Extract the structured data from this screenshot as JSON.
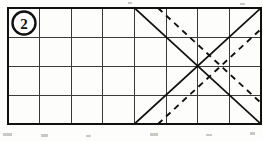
{
  "figure": {
    "label": "2",
    "label_name": "figure-number-badge",
    "background_color": "#fdfdfb",
    "ink_color": "#111111",
    "grid_line_color": "#3a3a3a"
  },
  "grid": {
    "columns": 8,
    "rows": 4,
    "left": 8,
    "top": 8,
    "right": 261,
    "bottom": 124,
    "cell_width": 31.6,
    "cell_height": 29,
    "x_positions": [
      8,
      39.6,
      71.2,
      102.8,
      134.4,
      166,
      197.6,
      229.2,
      261
    ],
    "y_positions": [
      8,
      37,
      66,
      95,
      124
    ]
  },
  "badge": {
    "center_x": 24,
    "center_y": 23,
    "radius": 11.5
  },
  "shapes": {
    "solid_x": {
      "name": "solid-diagonal-cross",
      "center_x": 197.6,
      "center_y": 66,
      "lines": [
        {
          "name": "solid-diagonal-down-right",
          "x1": 134.4,
          "y1": 8,
          "x2": 261,
          "y2": 124
        },
        {
          "name": "solid-diagonal-up-right",
          "x1": 134.4,
          "y1": 124,
          "x2": 261,
          "y2": 8
        }
      ]
    },
    "dashed_x": {
      "name": "dashed-diagonal-cross",
      "center_x": 221,
      "center_y": 66,
      "lines": [
        {
          "name": "dashed-diagonal-down-right",
          "x1": 158,
          "y1": 8,
          "x2": 261,
          "y2": 103
        },
        {
          "name": "dashed-diagonal-up-right",
          "x1": 158,
          "y1": 124,
          "x2": 261,
          "y2": 29
        }
      ]
    }
  },
  "specks": [
    {
      "x": 3,
      "y": 133,
      "w": 9,
      "h": 3
    },
    {
      "x": 41,
      "y": 134,
      "w": 7,
      "h": 3
    },
    {
      "x": 86,
      "y": 135,
      "w": 5,
      "h": 2
    },
    {
      "x": 150,
      "y": 133,
      "w": 8,
      "h": 3
    },
    {
      "x": 206,
      "y": 134,
      "w": 6,
      "h": 2
    },
    {
      "x": 250,
      "y": 132,
      "w": 5,
      "h": 3
    },
    {
      "x": 128,
      "y": 2,
      "w": 4,
      "h": 2
    },
    {
      "x": 240,
      "y": 3,
      "w": 5,
      "h": 2
    }
  ]
}
